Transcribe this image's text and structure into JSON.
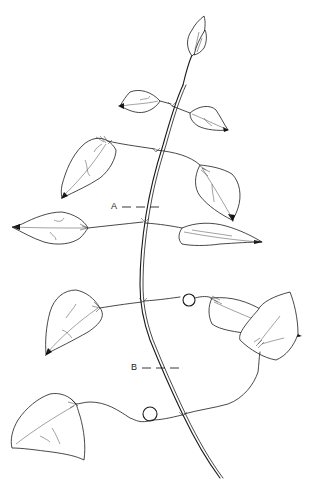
{
  "figure": {
    "labels": [
      {
        "id": "A",
        "text": "A"
      },
      {
        "id": "B",
        "text": "B"
      }
    ],
    "colors": {
      "ink": "#1a1a1a",
      "background": "#ffffff"
    }
  }
}
